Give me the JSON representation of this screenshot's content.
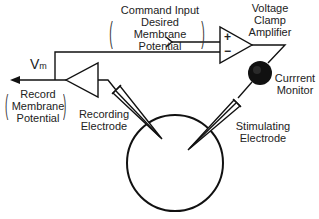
{
  "labels": {
    "command_input": [
      "Command Input",
      "Desired",
      "Membrane",
      "Potential"
    ],
    "voltage_clamp_amplifier": [
      "Voltage",
      "Clamp",
      "Amplifier"
    ],
    "vm": {
      "main": "V",
      "sub": "m"
    },
    "record": [
      "Record",
      "Membrane",
      "Potential"
    ],
    "recording_electrode": [
      "Recording",
      "Electrode"
    ],
    "current_monitor": [
      "Currrent",
      "Monitor"
    ],
    "stimulating_electrode": [
      "Stimulating",
      "Electrode"
    ],
    "plus_sign": "+",
    "minus_sign": "−"
  },
  "colors": {
    "line": "#111111",
    "background": "#ffffff",
    "monitor_fill": "#111111"
  }
}
